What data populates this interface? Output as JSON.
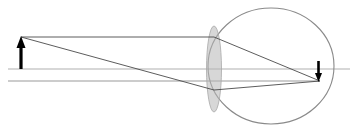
{
  "diagram": {
    "kind": "optical-ray-diagram",
    "canvas": {
      "width": 355,
      "height": 130,
      "background": "#ffffff"
    },
    "colors": {
      "object_arrow": "#000000",
      "image_arrow": "#000000",
      "ray_line": "#4a4a4a",
      "optical_axis": "#b0b0b0",
      "eyeball_outline": "#8a8a8a",
      "lens_fill": "#b7b7b7",
      "lens_outline": "#a8a8a8",
      "chief_ray": "#9a9a9a"
    },
    "optical_axis": {
      "label": "optical-axis",
      "y": 69,
      "x_start": 8,
      "x_end": 350,
      "stroke_width": 1.2
    },
    "object_arrow": {
      "label": "object-arrow-upright",
      "x": 21,
      "base_y": 69,
      "tip_y": 37,
      "direction": "up",
      "shaft_width": 3.2,
      "head_width": 9,
      "head_height": 11
    },
    "image_arrow": {
      "label": "image-arrow-inverted",
      "x": 318.5,
      "base_y": 61,
      "tip_y": 81,
      "direction": "down",
      "shaft_width": 2.6,
      "head_width": 7,
      "head_height": 8
    },
    "eyeball": {
      "label": "eyeball-outline",
      "center_x": 271,
      "center_y": 66,
      "radius_x": 63,
      "radius_y": 58,
      "stroke_width": 1.1
    },
    "lens": {
      "label": "crystalline-lens",
      "center_x": 214,
      "center_y": 69,
      "radius_x": 7.5,
      "radius_y": 43,
      "fill_opacity": 0.55
    },
    "rays": [
      {
        "name": "ray-parallel-top",
        "points": [
          [
            21,
            37
          ],
          [
            214,
            37
          ],
          [
            320,
            81
          ]
        ],
        "stroke_width": 0.9,
        "description": "Parallel ray from object tip, refracted through lens to retina"
      },
      {
        "name": "ray-oblique-through-center",
        "points": [
          [
            21,
            37
          ],
          [
            214,
            90
          ],
          [
            320,
            81
          ]
        ],
        "stroke_width": 0.9,
        "description": "Oblique ray from object tip crossing the lens low, converging at image point"
      },
      {
        "name": "ray-lower-horizontal",
        "points": [
          [
            8,
            81
          ],
          [
            214,
            81
          ],
          [
            320,
            81
          ]
        ],
        "stroke_width": 1.1,
        "description": "Lower horizontal construction line meeting the image point"
      }
    ],
    "annotations": {
      "object_side": "left",
      "image_side": "right",
      "image_orientation": "inverted",
      "image_location": "retina"
    }
  }
}
